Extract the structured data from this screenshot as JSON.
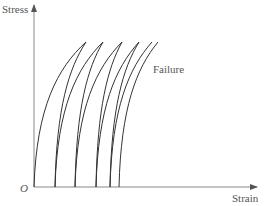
{
  "chart_data": {
    "type": "line",
    "title": "",
    "xlabel": "Strain",
    "ylabel": "Stress",
    "origin_label": "O",
    "annotations": [
      {
        "text": "Failure",
        "x": 153,
        "y": 64
      }
    ],
    "grid": false,
    "legend": null,
    "axis": {
      "origin_px": [
        34,
        187
      ],
      "y_top_px": 5,
      "x_right_px": 257
    },
    "curves": [
      {
        "start_x": 34,
        "peak": [
          86,
          42
        ]
      },
      {
        "start_x": 55,
        "peak": [
          86,
          42
        ]
      },
      {
        "start_x": 55,
        "peak": [
          103,
          42
        ]
      },
      {
        "start_x": 75,
        "peak": [
          103,
          42
        ]
      },
      {
        "start_x": 75,
        "peak": [
          122,
          42
        ]
      },
      {
        "start_x": 96,
        "peak": [
          122,
          42
        ]
      },
      {
        "start_x": 96,
        "peak": [
          139,
          42
        ]
      },
      {
        "start_x": 110,
        "peak": [
          139,
          42
        ]
      },
      {
        "start_x": 110,
        "peak": [
          152,
          42
        ]
      },
      {
        "start_x": 119,
        "peak": [
          158,
          42
        ]
      }
    ],
    "colors": {
      "curve": "#333333",
      "axis": "#777777",
      "text": "#555555"
    }
  }
}
